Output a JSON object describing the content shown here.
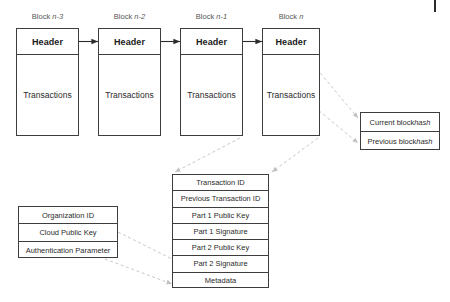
{
  "diagram": {
    "colors": {
      "stroke": "#3d3d3d",
      "dashed_connector": "#c8c8c8",
      "label_text": "#565656",
      "body_text": "#2b2b2b",
      "background": "#ffffff"
    }
  },
  "blocks": [
    {
      "label_prefix": "Block ",
      "label_var": "n-3",
      "header": "Header",
      "body": "Transactions"
    },
    {
      "label_prefix": "Block ",
      "label_var": "n-2",
      "header": "Header",
      "body": "Transactions"
    },
    {
      "label_prefix": "Block ",
      "label_var": "n-1",
      "header": "Header",
      "body": "Transactions"
    },
    {
      "label_prefix": "Block ",
      "label_var": "n",
      "header": "Header",
      "body": "Transactions"
    }
  ],
  "hash_box": {
    "rows": [
      {
        "prefix": "Current block ",
        "italic": "hash"
      },
      {
        "prefix": "Previous block ",
        "italic": "hash"
      }
    ]
  },
  "transaction_box": {
    "rows": [
      "Transaction ID",
      "Previous Transaction ID",
      "Part 1 Public Key",
      "Part 1 Signature",
      "Part 2 Public Key",
      "Part 2 Signature",
      "Metadata"
    ]
  },
  "organization_box": {
    "rows": [
      "Organization ID",
      "Cloud Public Key",
      "Authentication Parameter"
    ]
  }
}
